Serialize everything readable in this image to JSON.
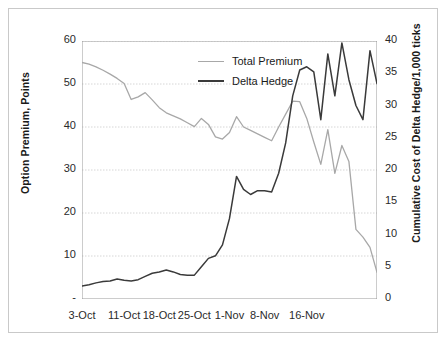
{
  "chart_data": {
    "type": "line",
    "title": "",
    "xlabel": "",
    "ylabel": "Option Premium, Points",
    "y2label": "Cumulative Cost of Delta Hedge/1,000 ticks",
    "grid": true,
    "legend_position": "top-center",
    "ylim": [
      0,
      60
    ],
    "y2lim": [
      0,
      40
    ],
    "y_ticks": [
      "-",
      "10",
      "20",
      "30",
      "40",
      "50",
      "60"
    ],
    "y_tick_values": [
      0,
      10,
      20,
      30,
      40,
      50,
      60
    ],
    "y2_ticks": [
      "0",
      "5",
      "10",
      "15",
      "20",
      "25",
      "30",
      "35",
      "40"
    ],
    "y2_tick_values": [
      0,
      5,
      10,
      15,
      20,
      25,
      30,
      35,
      40
    ],
    "x_tick_labels": [
      "3-Oct",
      "11-Oct",
      "18-Oct",
      "25-Oct",
      "1-Nov",
      "8-Nov",
      "16-Nov"
    ],
    "x_tick_indices": [
      0,
      6,
      11,
      16,
      21,
      26,
      32
    ],
    "x_index_count": 39,
    "colors": {
      "total_premium": "#a8a8a8",
      "delta_hedge": "#3a3a3a",
      "grid": "#cccccc",
      "axis": "#999999",
      "frame": "#c9c9c9",
      "text": "#1a1a1a"
    },
    "series": [
      {
        "name": "Total Premium",
        "axis": "left",
        "color": "#a8a8a8",
        "values": [
          55.0,
          54.6,
          54.0,
          53.2,
          52.3,
          51.3,
          50.1,
          46.4,
          47.0,
          48.0,
          46.3,
          44.5,
          43.3,
          42.6,
          41.9,
          41.0,
          40.1,
          42.0,
          40.6,
          37.7,
          37.2,
          38.7,
          42.4,
          40.0,
          39.2,
          38.4,
          37.6,
          36.8,
          40.0,
          43.0,
          46.0,
          45.9,
          42.0,
          36.5,
          31.3,
          39.4,
          29.2,
          35.7,
          32.0,
          16.2,
          14.4,
          12.0,
          6.2
        ]
      },
      {
        "name": "Delta Hedge",
        "axis": "right",
        "color": "#3a3a3a",
        "values": [
          2.0,
          2.2,
          2.5,
          2.7,
          2.8,
          3.1,
          2.9,
          2.8,
          3.0,
          3.5,
          4.0,
          4.2,
          4.5,
          4.2,
          3.8,
          3.7,
          3.7,
          5.0,
          6.3,
          6.7,
          8.4,
          12.5,
          19.0,
          17.0,
          16.2,
          16.8,
          16.8,
          16.6,
          19.5,
          24.2,
          31.5,
          35.5,
          36.0,
          35.2,
          27.8,
          38.0,
          31.5,
          39.7,
          34.0,
          30.0,
          27.8,
          38.5,
          33.4
        ]
      }
    ]
  },
  "legend": {
    "items": [
      {
        "label": "Total Premium",
        "color": "#a8a8a8",
        "width": 1.6
      },
      {
        "label": "Delta Hedge",
        "color": "#3a3a3a",
        "width": 2.2
      }
    ]
  },
  "axes": {
    "left_title": "Option Premium, Points",
    "right_title": "Cumulative Cost of Delta Hedge/1,000 ticks"
  }
}
